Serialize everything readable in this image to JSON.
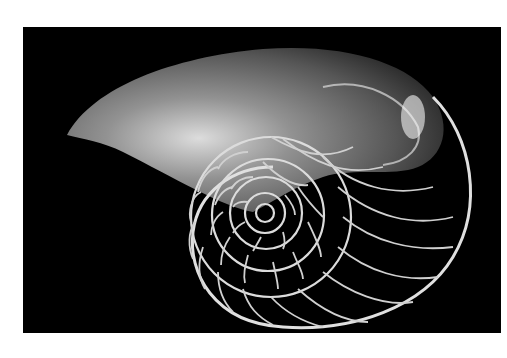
{
  "image": {
    "subject": "Nautilus shell cross-section",
    "alt": "Black and white photograph of a nautilus shell cut in half showing its spiral chambers on a black background",
    "background_color": "#000000",
    "page_color": "#ffffff",
    "shell_color": "#d8d8d8"
  }
}
